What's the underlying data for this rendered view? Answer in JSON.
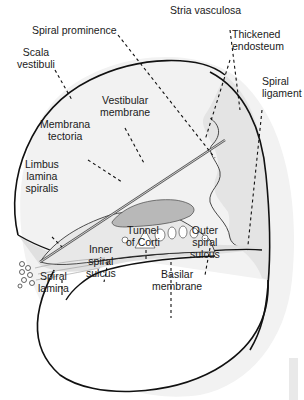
{
  "diagram": {
    "labels": {
      "stria_vasculosa": [
        "Stria vasculosa"
      ],
      "spiral_prominence": [
        "Spiral prominence"
      ],
      "thickened_endosteum": [
        "Thickened",
        "endosteum"
      ],
      "scala_vestibuli": [
        "Scala",
        "vestibuli"
      ],
      "spiral_ligament": [
        "Spiral",
        "ligament"
      ],
      "vestibular_membrane": [
        "Vestibular",
        "membrane"
      ],
      "membrana_tectoria": [
        "Membrana",
        "tectoria"
      ],
      "limbus_lamina_spiralis": [
        "Limbus",
        "lamina",
        "spiralis"
      ],
      "tunnel_of_corti": [
        "Tunnel",
        "of Corti"
      ],
      "outer_spiral_sulcus": [
        "Outer",
        "spiral",
        "sulcus"
      ],
      "inner_spiral_sulcus": [
        "Inner",
        "spiral",
        "sulcus"
      ],
      "spiral_lamina": [
        "Spiral",
        "lamina"
      ],
      "basilar_membrane": [
        "Basilar",
        "membrane"
      ]
    },
    "colors": {
      "outline": "#111111",
      "tissue_fill": "#e2e2e2",
      "shadow": "#f1f1f1",
      "tectoria_fill": "#b9b9b9",
      "text": "#1a1a1a"
    }
  }
}
